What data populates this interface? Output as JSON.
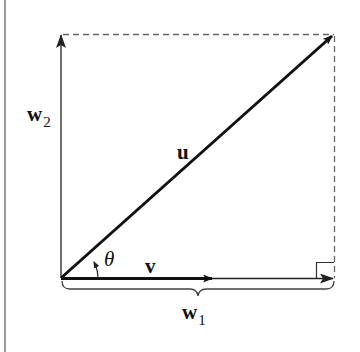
{
  "diagram": {
    "colors": {
      "stroke": "#111111",
      "thin_stroke": "#333333",
      "dashed": "#666666",
      "border": "#9a9a9a",
      "background": "#ffffff"
    },
    "labels": {
      "u": "u",
      "v": "v",
      "w2_base": "w",
      "w2_sub": "2",
      "w1_base": "w",
      "w1_sub": "1",
      "theta": "θ"
    },
    "elements": [
      {
        "id": "u",
        "type": "vector",
        "from": [
          61,
          278
        ],
        "to": [
          333,
          35
        ],
        "weight": "thick"
      },
      {
        "id": "v",
        "type": "vector",
        "from": [
          61,
          278
        ],
        "to": [
          212,
          278
        ],
        "weight": "thick"
      },
      {
        "id": "w1",
        "type": "vector",
        "from": [
          61,
          278
        ],
        "to": [
          333,
          278
        ],
        "weight": "thin"
      },
      {
        "id": "w2",
        "type": "vector",
        "from": [
          61,
          278
        ],
        "to": [
          61,
          34
        ],
        "weight": "thin"
      },
      {
        "id": "dashed-top",
        "type": "dashed-line",
        "from": [
          62,
          34
        ],
        "to": [
          334,
          34
        ]
      },
      {
        "id": "dashed-right",
        "type": "dashed-line",
        "from": [
          334,
          34
        ],
        "to": [
          334,
          278
        ]
      },
      {
        "id": "right-angle",
        "type": "right-angle-marker",
        "corner": [
          334,
          278
        ],
        "size": 17
      },
      {
        "id": "theta-arc",
        "type": "angle-arc",
        "vertex": [
          61,
          278
        ]
      },
      {
        "id": "w1-brace",
        "type": "brace",
        "from": [
          62,
          282
        ],
        "to": [
          334,
          282
        ],
        "tip": [
          198,
          297
        ]
      }
    ]
  }
}
